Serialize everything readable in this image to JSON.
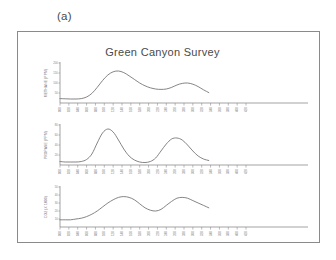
{
  "panel_label": "(a)",
  "figure": {
    "title": "Green Canyon Survey",
    "frame_color": "#8a8a8a",
    "line_color": "#6f6f6f",
    "axis_color": "#7d7d7d",
    "text_color": "#7a7a7a"
  },
  "chart_data": [
    {
      "type": "line",
      "title": "Green Canyon Survey",
      "ylabel": "METHANE (PPM)",
      "xlabel": "",
      "grid": false,
      "legend": "none",
      "ylim": [
        0,
        200
      ],
      "yticks": [
        50,
        100,
        150,
        200
      ],
      "ytick_labels": [
        "50",
        "100",
        "150",
        "200"
      ],
      "xlim": [
        0,
        28
      ],
      "xticks": [
        0,
        1,
        2,
        3,
        4,
        5,
        6,
        7,
        8,
        9,
        10,
        11,
        12,
        13,
        14,
        15,
        16,
        17,
        18,
        19,
        20,
        21
      ],
      "xtick_labels": [
        "000",
        "020",
        "040",
        "060",
        "080",
        "100",
        "120",
        "140",
        "160",
        "180",
        "200",
        "220",
        "240",
        "260",
        "280",
        "300",
        "320",
        "340",
        "360",
        "380",
        "400",
        "420"
      ],
      "x": [
        0.0,
        0.6,
        1.2,
        1.8,
        2.4,
        3.0,
        3.6,
        4.2,
        4.8,
        5.4,
        6.0,
        6.6,
        7.2,
        7.8,
        8.4,
        9.0,
        9.6,
        10.2,
        10.8,
        11.4,
        12.0,
        12.6,
        13.2,
        13.8,
        14.4,
        15.0,
        15.6,
        16.2,
        16.8
      ],
      "y": [
        22,
        21,
        20,
        20,
        22,
        30,
        48,
        78,
        112,
        140,
        156,
        160,
        152,
        136,
        118,
        100,
        86,
        76,
        70,
        68,
        70,
        78,
        90,
        98,
        100,
        94,
        82,
        66,
        52
      ]
    },
    {
      "type": "line",
      "title": "",
      "ylabel": "PROPANE (PPM)",
      "xlabel": "",
      "grid": false,
      "legend": "none",
      "ylim": [
        0,
        80
      ],
      "yticks": [
        20,
        40,
        60,
        80
      ],
      "ytick_labels": [
        "20",
        "40",
        "60",
        "80"
      ],
      "xlim": [
        0,
        28
      ],
      "xticks": [
        0,
        1,
        2,
        3,
        4,
        5,
        6,
        7,
        8,
        9,
        10,
        11,
        12,
        13,
        14,
        15,
        16,
        17,
        18,
        19,
        20,
        21
      ],
      "xtick_labels": [
        "000",
        "020",
        "040",
        "060",
        "080",
        "100",
        "120",
        "140",
        "160",
        "180",
        "200",
        "220",
        "240",
        "260",
        "280",
        "300",
        "320",
        "340",
        "360",
        "380",
        "400",
        "420"
      ],
      "x": [
        0.0,
        0.6,
        1.2,
        1.8,
        2.4,
        3.0,
        3.6,
        4.2,
        4.8,
        5.4,
        6.0,
        6.6,
        7.2,
        7.8,
        8.4,
        9.0,
        9.6,
        10.2,
        10.8,
        11.4,
        12.0,
        12.6,
        13.2,
        13.8,
        14.4,
        15.0,
        15.6,
        16.2,
        16.8
      ],
      "y": [
        7,
        6,
        6,
        6,
        7,
        11,
        22,
        44,
        64,
        72,
        66,
        50,
        32,
        18,
        10,
        6,
        5,
        7,
        14,
        28,
        42,
        52,
        54,
        50,
        40,
        28,
        18,
        12,
        9
      ]
    },
    {
      "type": "line",
      "title": "",
      "ylabel": "CO2 (X 1000)",
      "xlabel": "",
      "grid": false,
      "legend": "none",
      "ylim": [
        0,
        50
      ],
      "yticks": [
        10,
        20,
        30,
        40,
        50
      ],
      "ytick_labels": [
        "10",
        "20",
        "30",
        "40",
        "50"
      ],
      "xlim": [
        0,
        28
      ],
      "xticks": [
        0,
        1,
        2,
        3,
        4,
        5,
        6,
        7,
        8,
        9,
        10,
        11,
        12,
        13,
        14,
        15,
        16,
        17,
        18,
        19,
        20,
        21
      ],
      "xtick_labels": [
        "000",
        "020",
        "040",
        "060",
        "080",
        "100",
        "120",
        "140",
        "160",
        "180",
        "200",
        "220",
        "240",
        "260",
        "280",
        "300",
        "320",
        "340",
        "360",
        "380",
        "400",
        "420"
      ],
      "x": [
        0.0,
        0.6,
        1.2,
        1.8,
        2.4,
        3.0,
        3.6,
        4.2,
        4.8,
        5.4,
        6.0,
        6.6,
        7.2,
        7.8,
        8.4,
        9.0,
        9.6,
        10.2,
        10.8,
        11.4,
        12.0,
        12.6,
        13.2,
        13.8,
        14.4,
        15.0,
        15.6,
        16.2,
        16.8
      ],
      "y": [
        9,
        9,
        9,
        10,
        11,
        13,
        16,
        20,
        25,
        30,
        34,
        37,
        38,
        37,
        34,
        29,
        24,
        21,
        20,
        22,
        27,
        32,
        36,
        37,
        36,
        33,
        30,
        27,
        24
      ]
    }
  ]
}
